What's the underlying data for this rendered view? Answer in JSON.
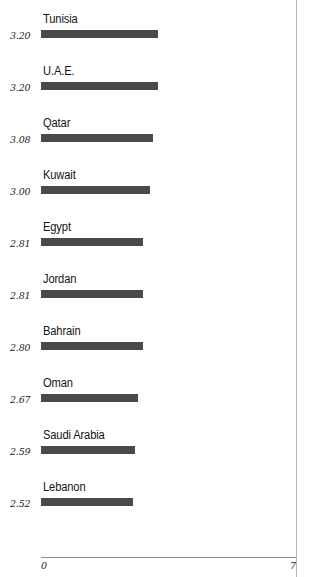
{
  "chart_data": {
    "type": "bar",
    "orientation": "horizontal",
    "title": "",
    "subtitle": "",
    "xlabel": "",
    "ylabel": "",
    "xlim": [
      0,
      7
    ],
    "axis_ticks": [
      "0",
      "7"
    ],
    "grid": false,
    "legend": null,
    "bar_color": "#4a4a4a",
    "categories": [
      "Tunisia",
      "U.A.E.",
      "Qatar",
      "Kuwait",
      "Egypt",
      "Jordan",
      "Bahrain",
      "Oman",
      "Saudi Arabia",
      "Lebanon"
    ],
    "values": [
      3.2,
      3.2,
      3.08,
      3.0,
      2.81,
      2.81,
      2.8,
      2.67,
      2.59,
      2.52
    ],
    "value_labels": [
      "3.20",
      "3.20",
      "3.08",
      "3.00",
      "2.81",
      "2.81",
      "2.80",
      "2.67",
      "2.59",
      "2.52"
    ],
    "rows": [
      {
        "category": "Tunisia",
        "value": 3.2,
        "value_label": "3.20"
      },
      {
        "category": "U.A.E.",
        "value": 3.2,
        "value_label": "3.20"
      },
      {
        "category": "Qatar",
        "value": 3.08,
        "value_label": "3.08"
      },
      {
        "category": "Kuwait",
        "value": 3.0,
        "value_label": "3.00"
      },
      {
        "category": "Egypt",
        "value": 2.81,
        "value_label": "2.81"
      },
      {
        "category": "Jordan",
        "value": 2.81,
        "value_label": "2.81"
      },
      {
        "category": "Bahrain",
        "value": 2.8,
        "value_label": "2.80"
      },
      {
        "category": "Oman",
        "value": 2.67,
        "value_label": "2.67"
      },
      {
        "category": "Saudi Arabia",
        "value": 2.59,
        "value_label": "2.59"
      },
      {
        "category": "Lebanon",
        "value": 2.52,
        "value_label": "2.52"
      }
    ]
  },
  "axis": {
    "min_label": "0",
    "max_label": "7"
  }
}
